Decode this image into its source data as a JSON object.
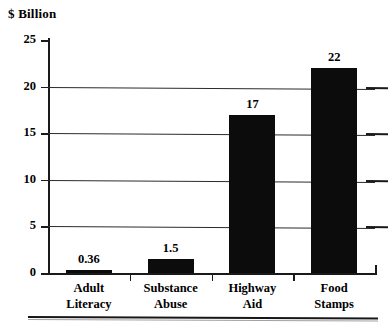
{
  "chart_data": {
    "type": "bar",
    "title": "",
    "ylabel": "$ Billion",
    "xlabel": "",
    "categories": [
      "Adult Literacy",
      "Substance Abuse",
      "Highway Aid",
      "Food Stamps"
    ],
    "category_lines": [
      [
        "Adult",
        "Literacy"
      ],
      [
        "Substance",
        "Abuse"
      ],
      [
        "Highway",
        "Aid"
      ],
      [
        "Food",
        "Stamps"
      ]
    ],
    "values": [
      0.36,
      1.5,
      17,
      22
    ],
    "value_labels": [
      "0.36",
      "1.5",
      "17",
      "22"
    ],
    "ylim": [
      0,
      25
    ],
    "yticks": [
      0,
      5,
      10,
      15,
      20,
      25
    ],
    "ytick_labels": [
      "0",
      "5",
      "10",
      "15",
      "20",
      "25"
    ],
    "grid": true,
    "gridlines_at": [
      5,
      10,
      15,
      20
    ],
    "legend": null,
    "legend_position": "none",
    "bar_color": "#0c0c0c",
    "axis_color": "#1a1a1a",
    "background": "#ffffff"
  }
}
